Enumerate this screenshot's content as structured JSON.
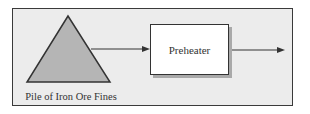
{
  "diagram": {
    "pile": {
      "label": "Pile of Iron Ore Fines",
      "fill": "#b5b5b5"
    },
    "process_box": {
      "label": "Preheater"
    },
    "arrows": [
      {
        "from": "pile",
        "to": "preheater"
      },
      {
        "from": "preheater",
        "to": "output"
      }
    ],
    "colors": {
      "frame_bg": "#ececec",
      "stroke": "#333333",
      "shadow": "#a9a9a9"
    }
  }
}
